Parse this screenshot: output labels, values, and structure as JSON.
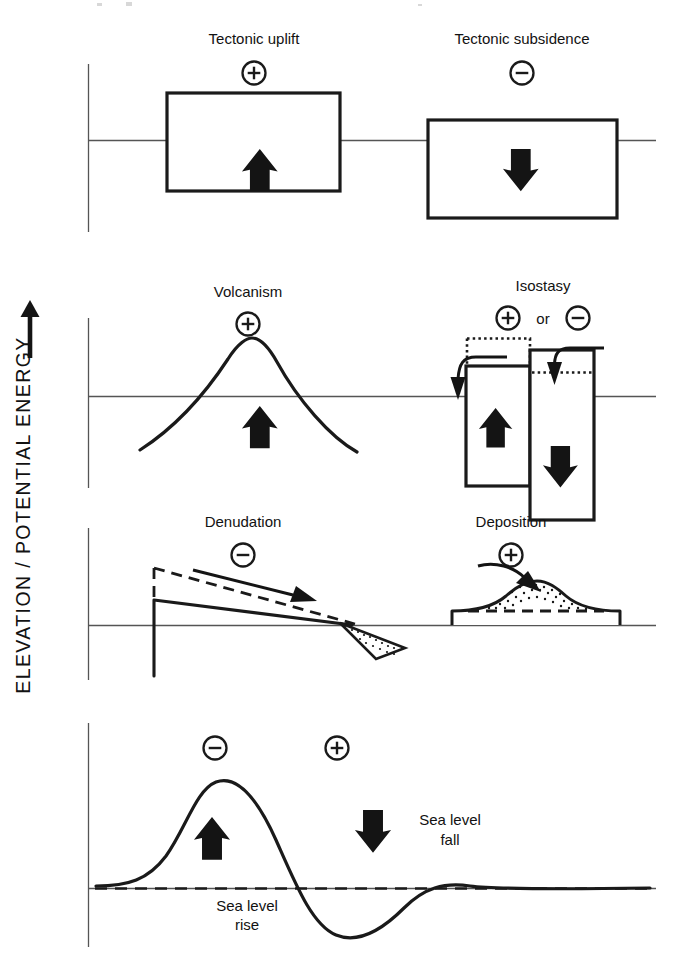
{
  "figure": {
    "axis_label": "ELEVATION / POTENTIAL ENERGY",
    "axis_arrow_icon": "up-arrow-icon"
  },
  "signs": {
    "positive": "+",
    "negative": "−",
    "conjunction": "or"
  },
  "panels": [
    {
      "id": "tectonics",
      "processes": [
        {
          "id": "tectonic-uplift",
          "title": "Tectonic uplift",
          "sign": "+",
          "motion": "up",
          "motion_icon": "up-arrow-icon"
        },
        {
          "id": "tectonic-subsidence",
          "title": "Tectonic subsidence",
          "sign": "−",
          "motion": "down",
          "motion_icon": "down-arrow-icon"
        }
      ]
    },
    {
      "id": "volcanism-isostasy",
      "processes": [
        {
          "id": "volcanism",
          "title": "Volcanism",
          "sign": "+",
          "motion": "up",
          "motion_icon": "up-arrow-icon"
        },
        {
          "id": "isostasy",
          "title": "Isostasy",
          "sign": "+",
          "sign_alt": "−",
          "conjunction": "or",
          "motion": "up and down",
          "motion_icon": "up-down-arrow-icon"
        }
      ]
    },
    {
      "id": "denudation-deposition",
      "processes": [
        {
          "id": "denudation",
          "title": "Denudation",
          "sign": "−",
          "motion": "transport away",
          "motion_icon": "right-arrow-icon"
        },
        {
          "id": "deposition",
          "title": "Deposition",
          "sign": "+",
          "motion": "transport in",
          "motion_icon": "curved-right-arrow-icon"
        }
      ]
    },
    {
      "id": "sea-level",
      "processes": [
        {
          "id": "sea-level-rise",
          "title": "Sea level rise",
          "sign": "−",
          "motion": "up",
          "motion_icon": "up-arrow-icon"
        },
        {
          "id": "sea-level-fall",
          "title": "Sea level fall",
          "sign": "+",
          "motion": "down",
          "motion_icon": "down-arrow-icon"
        }
      ]
    }
  ],
  "sea_level_labels": {
    "rise_line1": "Sea level",
    "rise_line2": "rise",
    "fall_line1": "Sea level",
    "fall_line2": "fall"
  },
  "colors": {
    "ink": "#1a1a1a",
    "rule": "#555555",
    "paper": "#ffffff"
  }
}
